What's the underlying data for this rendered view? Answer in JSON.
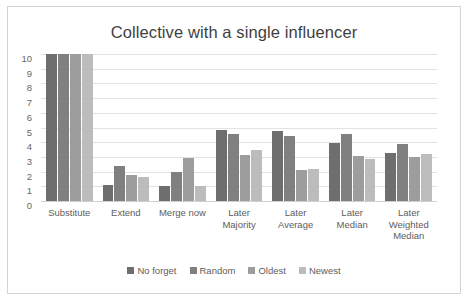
{
  "chart_data": {
    "type": "bar",
    "title": "Collective with a single influencer",
    "xlabel": "",
    "ylabel": "",
    "ylim": [
      0,
      10
    ],
    "yticks": [
      10,
      9,
      8,
      7,
      6,
      5,
      4,
      3,
      2,
      1,
      0
    ],
    "grid": true,
    "legend_position": "bottom",
    "categories": [
      "Substitute",
      "Extend",
      "Merge now",
      "Later\nMajority",
      "Later\nAverage",
      "Later\nMedian",
      "Later\nWeighted\nMedian"
    ],
    "category_lines": [
      [
        "Substitute"
      ],
      [
        "Extend"
      ],
      [
        "Merge now"
      ],
      [
        "Later",
        "Majority"
      ],
      [
        "Later",
        "Average"
      ],
      [
        "Later",
        "Median"
      ],
      [
        "Later",
        "Weighted",
        "Median"
      ]
    ],
    "series": [
      {
        "name": "No forget",
        "color": "#6e6e6e",
        "values": [
          10,
          1.1,
          1.05,
          4.85,
          4.75,
          3.95,
          3.3
        ]
      },
      {
        "name": "Random",
        "color": "#808080",
        "values": [
          10,
          2.4,
          1.95,
          4.55,
          4.45,
          4.55,
          3.85
        ]
      },
      {
        "name": "Oldest",
        "color": "#9d9d9d",
        "values": [
          10,
          1.8,
          2.95,
          3.1,
          2.1,
          3.05,
          3.0
        ]
      },
      {
        "name": "Newest",
        "color": "#bcbcbc",
        "values": [
          10,
          1.65,
          1.05,
          3.45,
          2.15,
          2.85,
          3.2
        ]
      }
    ]
  },
  "style": {
    "frame_border_color": "#d4d4d4",
    "gridline_color": "#e2e2e2",
    "title_color": "#3f3f3f",
    "tick_label_color": "#666666",
    "axis_label_color": "#5d5d5d",
    "background": "#ffffff"
  }
}
